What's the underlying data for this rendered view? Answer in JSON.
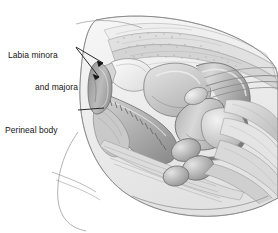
{
  "figure": {
    "kind": "medical-illustration",
    "style": "grayscale pencil/airbrush anatomical rendering",
    "background_color": "#ffffff",
    "ink_color": "#141414",
    "palette": {
      "outline": "#6e6e6e",
      "light_tissue": "#ededed",
      "mid_tissue": "#c6c6c6",
      "dark_tissue": "#8f8f8f",
      "deep_shadow": "#767676",
      "highlight": "#fbfbfb"
    }
  },
  "annotations": [
    {
      "id": "labia",
      "name": "labia-label",
      "line1": "Labia minora",
      "line2": "and majora",
      "leader_count": 2
    },
    {
      "id": "perineal",
      "name": "perineal-body-label",
      "line1": "Perineal body",
      "line2": "",
      "leader_count": 1
    }
  ],
  "leaders": {
    "labia_a": "M 76 48 L 104 64",
    "labia_b": "M 76 48 L 100 76",
    "perineal": "M 78 110 L 104 108"
  }
}
